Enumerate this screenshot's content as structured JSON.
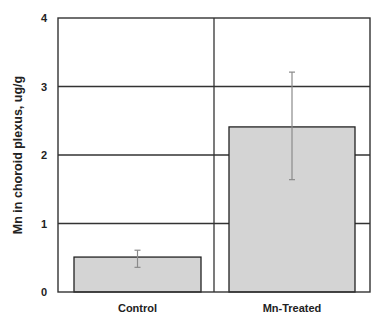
{
  "chart_data": {
    "type": "bar",
    "title": "",
    "xlabel": "",
    "ylabel": "Mn in choroid plexus, ug/g",
    "categories": [
      "Control",
      "Mn-Treated"
    ],
    "values": [
      0.51,
      2.41
    ],
    "error_bars": [
      {
        "low": 0.36,
        "high": 0.61
      },
      {
        "low": 1.64,
        "high": 3.21
      }
    ],
    "ylim": [
      0,
      4
    ],
    "yticks": [
      0,
      1,
      2,
      3,
      4
    ],
    "grid": true,
    "legend": null,
    "colors": {
      "bar_fill": "#d4d4d4",
      "bar_edge": "#222222",
      "error_bar": "#8a8a8a",
      "grid": "#333333",
      "axis": "#333333"
    }
  }
}
